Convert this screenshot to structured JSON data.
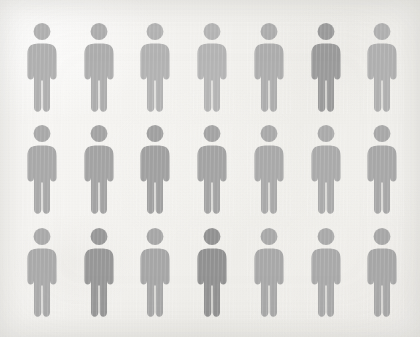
{
  "canvas": {
    "width": 420,
    "height": 337,
    "background_color": "#f2f1ef",
    "texture": "paper-scan-grain"
  },
  "infographic": {
    "title": "",
    "type": "pictogram-grid",
    "icon_name": "person-pictogram-icon",
    "rows": 3,
    "columns": 7,
    "total_figures": 21,
    "figure": {
      "width": 44,
      "height": 92,
      "column_spacing": 56.7,
      "first_column_center_x": 42,
      "row_top_y": [
        22,
        124,
        227
      ]
    },
    "palette": {
      "light_gray": "#b4b4b4",
      "medium_gray": "#a6a6a6",
      "gray": "#9d9d9d",
      "dark_gray": "#8c8c8c",
      "darkest_gray": "#858585"
    },
    "figures": [
      {
        "row": 1,
        "col": 1,
        "color": "#b0b0b0",
        "emphasis": "normal"
      },
      {
        "row": 1,
        "col": 2,
        "color": "#adadad",
        "emphasis": "normal"
      },
      {
        "row": 1,
        "col": 3,
        "color": "#b2b2b2",
        "emphasis": "normal"
      },
      {
        "row": 1,
        "col": 4,
        "color": "#b4b4b4",
        "emphasis": "normal"
      },
      {
        "row": 1,
        "col": 5,
        "color": "#adadad",
        "emphasis": "normal"
      },
      {
        "row": 1,
        "col": 6,
        "color": "#9a9a9a",
        "emphasis": "highlighted"
      },
      {
        "row": 1,
        "col": 7,
        "color": "#b0b0b0",
        "emphasis": "normal"
      },
      {
        "row": 2,
        "col": 1,
        "color": "#a9a9a9",
        "emphasis": "normal"
      },
      {
        "row": 2,
        "col": 2,
        "color": "#a3a3a3",
        "emphasis": "normal"
      },
      {
        "row": 2,
        "col": 3,
        "color": "#a0a0a0",
        "emphasis": "normal"
      },
      {
        "row": 2,
        "col": 4,
        "color": "#a3a3a3",
        "emphasis": "normal"
      },
      {
        "row": 2,
        "col": 5,
        "color": "#a9a9a9",
        "emphasis": "normal"
      },
      {
        "row": 2,
        "col": 6,
        "color": "#aaaaaa",
        "emphasis": "normal"
      },
      {
        "row": 2,
        "col": 7,
        "color": "#a8a8a8",
        "emphasis": "normal"
      },
      {
        "row": 3,
        "col": 1,
        "color": "#aaaaaa",
        "emphasis": "normal"
      },
      {
        "row": 3,
        "col": 2,
        "color": "#979797",
        "emphasis": "highlighted"
      },
      {
        "row": 3,
        "col": 3,
        "color": "#a6a6a6",
        "emphasis": "normal"
      },
      {
        "row": 3,
        "col": 4,
        "color": "#919191",
        "emphasis": "highlighted"
      },
      {
        "row": 3,
        "col": 5,
        "color": "#a8a8a8",
        "emphasis": "normal"
      },
      {
        "row": 3,
        "col": 6,
        "color": "#a9a9a9",
        "emphasis": "normal"
      },
      {
        "row": 3,
        "col": 7,
        "color": "#a7a7a7",
        "emphasis": "normal"
      }
    ]
  },
  "chart_data": {
    "type": "pictogram",
    "title": "",
    "subtitle": "",
    "xlabel": "",
    "ylabel": "",
    "icon": "person",
    "grid": {
      "rows": 3,
      "columns": 7
    },
    "categories": [
      "normal",
      "highlighted"
    ],
    "values": [
      18,
      3
    ],
    "total": 21,
    "legend": [],
    "annotations": []
  }
}
